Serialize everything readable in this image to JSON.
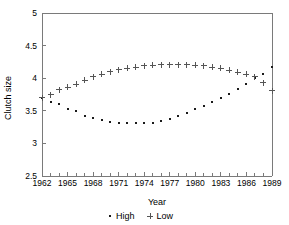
{
  "chart_data": {
    "type": "scatter",
    "title": "",
    "xlabel": "Year",
    "ylabel": "Clutch size",
    "xlim": [
      1962,
      1989
    ],
    "ylim": [
      2.5,
      5
    ],
    "grid": false,
    "legend_position": "bottom",
    "x_ticks_major": [
      1962,
      1965,
      1968,
      1971,
      1974,
      1977,
      1980,
      1983,
      1986,
      1989
    ],
    "x_ticks_minor_step": 1,
    "y_ticks": [
      "2.5",
      "3",
      "3.5",
      "4",
      "4.5",
      "5"
    ],
    "y_tick_values": [
      2.5,
      3,
      3.5,
      4,
      4.5,
      5
    ],
    "x": [
      1962,
      1963,
      1964,
      1965,
      1966,
      1967,
      1968,
      1969,
      1970,
      1971,
      1972,
      1973,
      1974,
      1975,
      1976,
      1977,
      1978,
      1979,
      1980,
      1981,
      1982,
      1983,
      1984,
      1985,
      1986,
      1987,
      1988,
      1989
    ],
    "series": [
      {
        "name": "High",
        "marker": "dot",
        "color": "#1a1a1a",
        "values": [
          3.7,
          3.63,
          3.6,
          3.53,
          3.49,
          3.42,
          3.39,
          3.36,
          3.33,
          3.31,
          3.31,
          3.31,
          3.32,
          3.32,
          3.34,
          3.38,
          3.42,
          3.47,
          3.53,
          3.58,
          3.64,
          3.7,
          3.76,
          3.84,
          3.91,
          4.01,
          4.07,
          4.17
        ]
      },
      {
        "name": "Low",
        "marker": "plus",
        "color": "#555555",
        "values": [
          3.7,
          3.75,
          3.82,
          3.86,
          3.91,
          3.97,
          4.02,
          4.06,
          4.1,
          4.13,
          4.15,
          4.17,
          4.19,
          4.2,
          4.21,
          4.21,
          4.21,
          4.21,
          4.2,
          4.19,
          4.17,
          4.15,
          4.12,
          4.09,
          4.06,
          4.02,
          3.93,
          3.81
        ]
      }
    ],
    "legend": [
      {
        "label": "High",
        "marker": "dot"
      },
      {
        "label": "Low",
        "marker": "plus"
      }
    ]
  },
  "geometry": {
    "plot_left": 42,
    "plot_right": 272,
    "plot_top": 13,
    "plot_bottom": 176
  }
}
